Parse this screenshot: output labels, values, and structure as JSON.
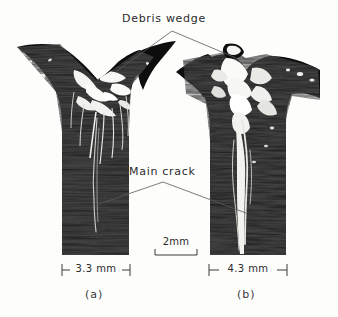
{
  "figure": {
    "type": "micrograph-figure",
    "background_color": "#fdfdfc",
    "ink_color": "#111111",
    "leader_line_color": "#555555",
    "annotations": {
      "debris_wedge_label": "Debris  wedge",
      "main_crack_label": "Main  crack",
      "scale_bar_label": "2mm"
    },
    "dimensions": {
      "left_width": "3.3 mm",
      "right_width": "4.3 mm"
    },
    "subfigures": [
      {
        "id": "a",
        "caption": "(a)",
        "width_label": "3.3 mm"
      },
      {
        "id": "b",
        "caption": "(b)",
        "width_label": "4.3 mm"
      }
    ],
    "scale": {
      "length_label": "2mm",
      "bar_pixels": 42
    }
  }
}
